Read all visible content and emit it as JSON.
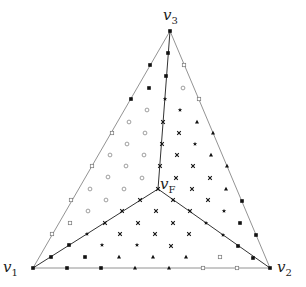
{
  "diagram": {
    "vertices": {
      "v1": {
        "label": "v",
        "sub": "1",
        "x": 33,
        "y": 268
      },
      "v2": {
        "label": "v",
        "sub": "2",
        "x": 270,
        "y": 268
      },
      "v3": {
        "label": "v",
        "sub": "3",
        "x": 170,
        "y": 31
      },
      "vF": {
        "label": "v",
        "sub": "F",
        "x": 158,
        "y": 189
      }
    },
    "edges": [
      [
        "v1",
        "v2"
      ],
      [
        "v2",
        "v3"
      ],
      [
        "v3",
        "v1"
      ],
      [
        "v1",
        "vF"
      ],
      [
        "v2",
        "vF"
      ],
      [
        "v3",
        "vF"
      ]
    ],
    "markers": {
      "square_filled": [
        [
          170,
          31
        ],
        [
          168,
          53
        ],
        [
          150,
          65
        ],
        [
          166,
          76
        ],
        [
          149,
          88
        ],
        [
          131,
          99
        ],
        [
          33,
          268
        ],
        [
          67,
          268
        ],
        [
          101,
          268
        ],
        [
          51,
          257
        ],
        [
          69,
          245
        ],
        [
          85,
          257
        ],
        [
          242,
          201
        ],
        [
          240,
          223
        ],
        [
          256,
          235
        ],
        [
          253,
          258
        ],
        [
          238,
          246
        ],
        [
          270,
          268
        ]
      ],
      "circle_open": [
        [
          183,
          88
        ],
        [
          147,
          110
        ],
        [
          129,
          122
        ],
        [
          145,
          133
        ],
        [
          127,
          144
        ],
        [
          110,
          155
        ],
        [
          144,
          155
        ],
        [
          126,
          166
        ],
        [
          108,
          177
        ],
        [
          142,
          178
        ],
        [
          90,
          189
        ],
        [
          124,
          189
        ],
        [
          106,
          200
        ],
        [
          88,
          211
        ]
      ],
      "square_open": [
        [
          184,
          65
        ],
        [
          199,
          99
        ],
        [
          112,
          133
        ],
        [
          92,
          166
        ],
        [
          71,
          200
        ],
        [
          70,
          223
        ],
        [
          52,
          234
        ],
        [
          220,
          257
        ],
        [
          203,
          268
        ],
        [
          237,
          268
        ]
      ],
      "star": [
        [
          165,
          99
        ],
        [
          180,
          110
        ],
        [
          195,
          144
        ],
        [
          87,
          234
        ],
        [
          102,
          245
        ],
        [
          137,
          245
        ],
        [
          223,
          235
        ],
        [
          206,
          223
        ],
        [
          224,
          211
        ]
      ],
      "cross": [
        [
          163,
          122
        ],
        [
          179,
          133
        ],
        [
          162,
          144
        ],
        [
          177,
          155
        ],
        [
          160,
          166
        ],
        [
          193,
          166
        ],
        [
          176,
          178
        ],
        [
          210,
          178
        ],
        [
          158,
          189
        ],
        [
          192,
          189
        ],
        [
          140,
          200
        ],
        [
          173,
          200
        ],
        [
          208,
          200
        ],
        [
          122,
          211
        ],
        [
          156,
          211
        ],
        [
          190,
          211
        ],
        [
          105,
          223
        ],
        [
          138,
          223
        ],
        [
          173,
          223
        ],
        [
          120,
          234
        ],
        [
          155,
          234
        ],
        [
          189,
          234
        ],
        [
          171,
          246
        ]
      ],
      "triangle": [
        [
          197,
          122
        ],
        [
          213,
          133
        ],
        [
          211,
          155
        ],
        [
          227,
          166
        ],
        [
          226,
          189
        ],
        [
          119,
          257
        ],
        [
          153,
          257
        ],
        [
          186,
          257
        ],
        [
          135,
          268
        ],
        [
          169,
          268
        ]
      ]
    }
  }
}
